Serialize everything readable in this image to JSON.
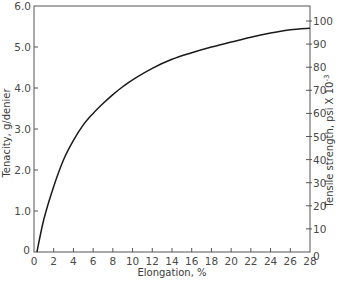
{
  "chart_data": {
    "type": "line",
    "title": "",
    "xlabel": "Elongation, %",
    "ylabel": "Tenacity, g/denier",
    "ylabel_right": "Tensile strength, psi X 10^-3",
    "xlim": [
      0,
      28
    ],
    "ylim": [
      0,
      6.0
    ],
    "ylim_right": [
      0,
      100
    ],
    "grid": false,
    "legend": null,
    "x_ticks": [
      0,
      2,
      4,
      6,
      8,
      10,
      12,
      14,
      16,
      18,
      20,
      22,
      24,
      26,
      28
    ],
    "y_ticks": [
      "0",
      "1.0",
      "2.0",
      "3.0",
      "4.0",
      "5.0",
      "6.0"
    ],
    "y_ticks_right": [
      "0",
      "10",
      "20",
      "30",
      "40",
      "50",
      "60",
      "70",
      "80",
      "90",
      "100"
    ],
    "series": [
      {
        "name": "Tenacity vs Elongation",
        "color": "#1a1a1a",
        "x": [
          0.3,
          1,
          2,
          3,
          4,
          5,
          6,
          7,
          8,
          9,
          10,
          12,
          14,
          16,
          18,
          20,
          22,
          24,
          26,
          28
        ],
        "y": [
          0,
          0.8,
          1.6,
          2.25,
          2.72,
          3.1,
          3.38,
          3.62,
          3.84,
          4.03,
          4.2,
          4.48,
          4.7,
          4.86,
          5.0,
          5.12,
          5.24,
          5.34,
          5.42,
          5.46
        ]
      }
    ]
  },
  "labels": {
    "xlabel": "Elongation, %",
    "ylabel_left": "Tenacity, g/denier",
    "ylabel_right_main": "Tensile strength, psi ",
    "ylabel_right_times": "X 10",
    "ylabel_right_exp": "-3"
  },
  "colors": {
    "axis": "#555555",
    "curve": "#1a1a1a",
    "text": "#4a4a4a"
  }
}
